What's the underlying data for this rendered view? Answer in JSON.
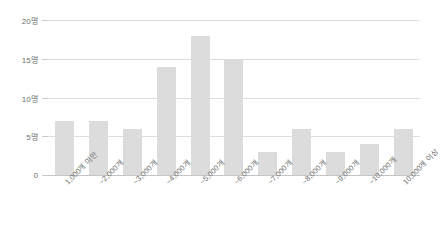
{
  "chart_data": {
    "type": "bar",
    "title": "",
    "subtitle": "",
    "xlabel": "",
    "ylabel": "",
    "categories": [
      "1,000개 미만",
      "~2,000개",
      "~3,000개",
      "~4,000개",
      "~5,000개",
      "~6,000개",
      "~7,000개",
      "~8,000개",
      "~9,000개",
      "~10,000개",
      "10,000개 이상"
    ],
    "values": [
      7,
      7,
      6,
      14,
      18,
      15,
      3,
      6,
      3,
      4,
      6
    ],
    "ylim": [
      0,
      20
    ],
    "y_ticks": [
      0,
      5,
      10,
      15,
      20
    ],
    "y_tick_labels": [
      "0",
      "5명",
      "10명",
      "15명",
      "20명"
    ],
    "unit": "명",
    "grid": true,
    "legend": "none",
    "bar_color": "#dcdcdc",
    "gridline_color": "#dddddd",
    "axis_color": "#c4c4c4",
    "background_color": "#ffffff",
    "text_color": "#6f6f6f"
  }
}
